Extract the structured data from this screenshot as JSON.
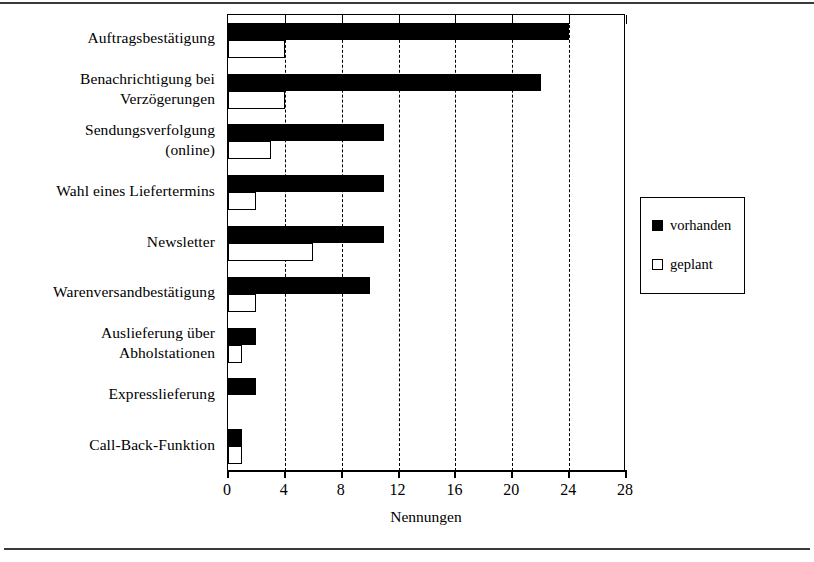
{
  "chart_data": {
    "type": "bar",
    "orientation": "horizontal",
    "title": "",
    "xlabel": "Nennungen",
    "ylabel": "",
    "xlim": [
      0,
      28
    ],
    "xticks": [
      0,
      4,
      8,
      12,
      16,
      20,
      24,
      28
    ],
    "xtick_labels": [
      "0",
      "4",
      "8",
      "12",
      "16",
      "20",
      "24",
      "28"
    ],
    "grid": "vertical-dashed",
    "legend_position": "right-outside",
    "categories": [
      "Auftragsbestätigung",
      "Benachrichtigung bei Verzögerungen",
      "Sendungsverfolgung (online)",
      "Wahl eines Liefertermins",
      "Newsletter",
      "Warenversandbestätigung",
      "Auslieferung über Abholstationen",
      "Expresslieferung",
      "Call-Back-Funktion"
    ],
    "category_lines": [
      [
        "Auftragsbestätigung"
      ],
      [
        "Benachrichtigung bei",
        "Verzögerungen"
      ],
      [
        "Sendungsverfolgung",
        "(online)"
      ],
      [
        "Wahl eines Liefertermins"
      ],
      [
        "Newsletter"
      ],
      [
        "Warenversandbestätigung"
      ],
      [
        "Auslieferung über",
        "Abholstationen"
      ],
      [
        "Expresslieferung"
      ],
      [
        "Call-Back-Funktion"
      ]
    ],
    "series": [
      {
        "name": "vorhanden",
        "color": "#000000",
        "style": "filled",
        "values": [
          24,
          22,
          11,
          11,
          11,
          10,
          2,
          2,
          1
        ]
      },
      {
        "name": "geplant",
        "color": "#ffffff",
        "style": "outlined",
        "values": [
          4,
          4,
          3,
          2,
          6,
          2,
          1,
          0,
          1
        ]
      }
    ]
  },
  "legend": {
    "entries": [
      {
        "label": "vorhanden",
        "swatch": "filled-square-icon"
      },
      {
        "label": "geplant",
        "swatch": "open-square-icon"
      }
    ]
  },
  "axis": {
    "x_title": "Nennungen"
  }
}
